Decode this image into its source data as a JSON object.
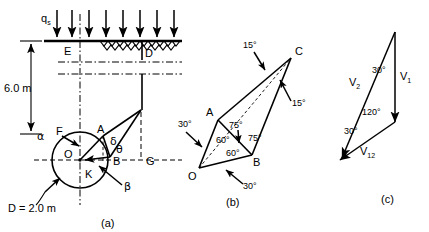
{
  "figure": {
    "panels": [
      {
        "id": "a",
        "caption": "(a)",
        "title": "retaining-wall-failure-mechanism"
      },
      {
        "id": "b",
        "caption": "(b)",
        "title": "rigid-block-geometry"
      },
      {
        "id": "c",
        "caption": "(c)",
        "title": "velocity-hodograph"
      }
    ]
  },
  "panel_a": {
    "caption": "(a)",
    "surcharge_label": "q",
    "surcharge_subscript": "s",
    "surcharge_arrow_count": 8,
    "depth_dimension": "6.0 m",
    "diameter_label": "D = 2.0 m",
    "points": [
      {
        "name": "E",
        "label": "E"
      },
      {
        "name": "D",
        "label": "D"
      },
      {
        "name": "C",
        "label": "C"
      },
      {
        "name": "F",
        "label": "F"
      },
      {
        "name": "A",
        "label": "A"
      },
      {
        "name": "B",
        "label": "B"
      },
      {
        "name": "G",
        "label": "G"
      },
      {
        "name": "O",
        "label": "O"
      },
      {
        "name": "K",
        "label": "K"
      }
    ],
    "angles": [
      {
        "name": "alpha",
        "label": "α"
      },
      {
        "name": "delta",
        "label": "δ"
      },
      {
        "name": "theta",
        "label": "θ"
      },
      {
        "name": "beta",
        "label": "β"
      }
    ]
  },
  "panel_b": {
    "caption": "(b)",
    "points": [
      {
        "name": "A",
        "label": "A"
      },
      {
        "name": "C",
        "label": "C"
      },
      {
        "name": "O",
        "label": "O"
      },
      {
        "name": "B",
        "label": "B"
      }
    ],
    "angles": [
      {
        "name": "top-edge-15",
        "label": "15°"
      },
      {
        "name": "right-edge-15",
        "label": "15°"
      },
      {
        "name": "left-outer-30",
        "label": "30°"
      },
      {
        "name": "bottom-outer-30",
        "label": "30°"
      },
      {
        "name": "upper-75",
        "label": "75°"
      },
      {
        "name": "right-75",
        "label": "75°"
      },
      {
        "name": "left-60",
        "label": "60°"
      },
      {
        "name": "lower-60",
        "label": "60°"
      }
    ]
  },
  "panel_c": {
    "caption": "(c)",
    "vectors": [
      {
        "name": "v1",
        "label": "V",
        "subscript": "1"
      },
      {
        "name": "v2",
        "label": "V",
        "subscript": "2"
      },
      {
        "name": "v12",
        "label": "V",
        "subscript": "12"
      }
    ],
    "angles": [
      {
        "name": "apex-30",
        "label": "30°"
      },
      {
        "name": "interior-120",
        "label": "120°"
      },
      {
        "name": "base-30",
        "label": "30°"
      }
    ]
  },
  "colors": {
    "ink": "#000000",
    "background": "#ffffff"
  }
}
